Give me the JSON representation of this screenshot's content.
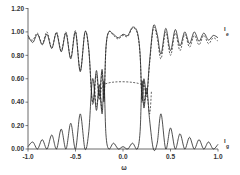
{
  "chart_data": {
    "type": "line",
    "title": "",
    "xlabel": "ω",
    "ylabel": "",
    "xlim": [
      -1.0,
      1.0
    ],
    "ylim": [
      0.0,
      1.2
    ],
    "grid": false,
    "legend_position": "inline-right",
    "x_ticks": [
      "-1.0",
      "-0.5",
      "0.0",
      "0.5",
      "1.0"
    ],
    "y_ticks": [
      "0.00",
      "0.20",
      "0.40",
      "0.60",
      "0.80",
      "1.00",
      "1.20"
    ],
    "series": [
      {
        "name": "I_e (solid)",
        "label": "I",
        "subscript": "e",
        "style": "solid",
        "x": [
          -1.0,
          -0.95,
          -0.9,
          -0.85,
          -0.8,
          -0.75,
          -0.7,
          -0.65,
          -0.6,
          -0.55,
          -0.5,
          -0.45,
          -0.4,
          -0.36,
          -0.32,
          -0.28,
          -0.25,
          -0.22,
          -0.2,
          -0.18,
          -0.15,
          -0.1,
          -0.05,
          0.0,
          0.05,
          0.1,
          0.15,
          0.18,
          0.2,
          0.22,
          0.25,
          0.28,
          0.32,
          0.36,
          0.4,
          0.45,
          0.5,
          0.55,
          0.6,
          0.65,
          0.7,
          0.75,
          0.8,
          0.85,
          0.9,
          0.95,
          1.0
        ],
        "values": [
          0.97,
          0.91,
          0.98,
          0.89,
          0.98,
          0.86,
          0.99,
          0.83,
          0.99,
          0.77,
          1.0,
          0.66,
          1.0,
          0.85,
          0.4,
          0.67,
          0.45,
          0.68,
          0.42,
          0.86,
          1.0,
          0.98,
          0.95,
          0.98,
          0.97,
          1.04,
          1.0,
          0.81,
          0.42,
          0.6,
          0.47,
          0.75,
          1.05,
          0.98,
          0.81,
          1.03,
          0.84,
          1.02,
          0.88,
          1.0,
          0.9,
          1.0,
          0.92,
          0.99,
          0.93,
          0.97,
          0.95
        ]
      },
      {
        "name": "I_e (dashed)",
        "label": "",
        "style": "dashed",
        "x": [
          -1.0,
          -0.95,
          -0.9,
          -0.85,
          -0.8,
          -0.75,
          -0.7,
          -0.65,
          -0.6,
          -0.55,
          -0.5,
          -0.45,
          -0.4,
          -0.36,
          -0.32,
          -0.28,
          -0.25,
          -0.22,
          -0.2,
          -0.18,
          -0.15,
          -0.1,
          -0.05,
          0.0,
          0.05,
          0.1,
          0.15,
          0.18,
          0.2,
          0.22,
          0.25,
          0.28,
          0.32,
          0.36,
          0.4,
          0.45,
          0.5,
          0.55,
          0.6,
          0.65,
          0.7,
          0.75,
          0.8,
          0.85,
          0.9,
          0.95,
          1.0
        ],
        "values": [
          0.95,
          0.93,
          0.99,
          0.9,
          1.0,
          0.86,
          1.0,
          0.84,
          1.0,
          0.78,
          1.01,
          0.67,
          1.0,
          0.84,
          0.38,
          0.64,
          0.42,
          0.66,
          0.4,
          0.85,
          1.0,
          0.97,
          0.94,
          0.97,
          0.96,
          1.03,
          0.99,
          0.8,
          0.4,
          0.58,
          0.45,
          0.73,
          1.03,
          0.95,
          0.77,
          1.0,
          0.8,
          0.99,
          0.84,
          0.98,
          0.87,
          0.97,
          0.89,
          0.97,
          0.9,
          0.95,
          0.92
        ]
      },
      {
        "name": "I_g (solid)",
        "label": "I",
        "subscript": "g",
        "style": "solid",
        "x": [
          -1.0,
          -0.95,
          -0.9,
          -0.85,
          -0.8,
          -0.75,
          -0.7,
          -0.65,
          -0.6,
          -0.55,
          -0.5,
          -0.45,
          -0.4,
          -0.36,
          -0.32,
          -0.28,
          -0.25,
          -0.22,
          -0.2,
          -0.18,
          -0.15,
          -0.1,
          -0.05,
          0.0,
          0.05,
          0.1,
          0.15,
          0.18,
          0.2,
          0.22,
          0.25,
          0.28,
          0.32,
          0.36,
          0.4,
          0.45,
          0.5,
          0.55,
          0.6,
          0.65,
          0.7,
          0.75,
          0.8,
          0.85,
          0.9,
          0.95,
          1.0
        ],
        "values": [
          0.02,
          0.06,
          0.0,
          0.08,
          0.0,
          0.12,
          0.0,
          0.17,
          0.0,
          0.22,
          0.0,
          0.3,
          0.0,
          0.15,
          0.6,
          0.33,
          0.55,
          0.3,
          0.58,
          0.13,
          0.0,
          0.05,
          0.0,
          0.02,
          0.0,
          0.05,
          0.0,
          0.15,
          0.58,
          0.35,
          0.52,
          0.25,
          0.0,
          0.05,
          0.3,
          0.0,
          0.18,
          0.0,
          0.13,
          0.0,
          0.1,
          0.0,
          0.08,
          0.0,
          0.06,
          0.0,
          0.04
        ]
      },
      {
        "name": "I_g (dashed)",
        "label": "",
        "style": "dashed",
        "x": [
          -0.3,
          -0.28,
          -0.25,
          -0.22,
          -0.2,
          0.2,
          0.22,
          0.25,
          0.28,
          0.3
        ],
        "values": [
          0.55,
          0.36,
          0.5,
          0.33,
          0.55,
          0.55,
          0.38,
          0.48,
          0.3,
          0.5
        ]
      }
    ],
    "annotations": [
      {
        "text": "I",
        "subscript": "e",
        "x_pos": "right",
        "y": 0.95
      },
      {
        "text": "I",
        "subscript": "g",
        "x_pos": "right",
        "y": 0.05
      }
    ]
  },
  "colors": {
    "line": "#222222",
    "axis": "#444444",
    "text": "#333333",
    "background": "#ffffff"
  }
}
